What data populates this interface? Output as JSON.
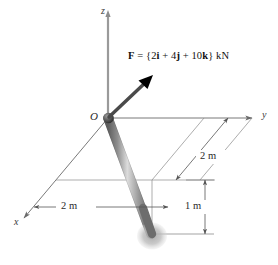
{
  "figure": {
    "type": "mechanics-free-body-diagram",
    "axes": {
      "z_label": "z",
      "y_label": "y",
      "x_label": "x",
      "origin_label": "O"
    },
    "force": {
      "label_text": "F = {2i + 4j + 10k} kN",
      "symbol": "F",
      "equals": "=",
      "open_brace": "{",
      "i_coefficient": "2",
      "i_unit": "i",
      "plus_1": "+",
      "j_coefficient": "4",
      "j_unit": "j",
      "plus_2": "+",
      "k_coefficient": "10",
      "k_unit": "k",
      "close_brace": "}",
      "units": "kN",
      "color": "#000000"
    },
    "dimensions": [
      {
        "name": "x-dimension",
        "value": "2 m"
      },
      {
        "name": "y-dimension",
        "value": "2 m"
      },
      {
        "name": "z-dimension",
        "value": "1 m"
      }
    ],
    "colors": {
      "rod_dark": "#6f6f6f",
      "rod_light": "#d8d8d8",
      "shadow": "#b9b9b9",
      "axis_line": "#6a6a6a",
      "dim_line": "#555555",
      "arrow_black": "#000000",
      "background": "#ffffff"
    }
  }
}
